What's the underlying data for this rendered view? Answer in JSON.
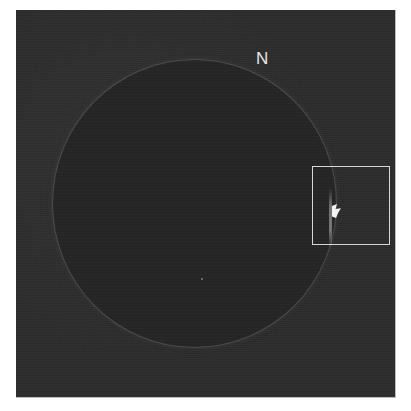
{
  "figure": {
    "orientation_label": "N",
    "highlight_box": {
      "description": "region of interest on west limb"
    },
    "colors": {
      "background": "#2c2c2c",
      "disk": "#262626",
      "annotation": "#e8e8e8",
      "flare": "#f2f2f2"
    }
  }
}
